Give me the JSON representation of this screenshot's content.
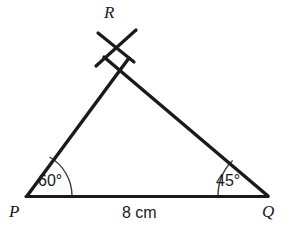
{
  "figure": {
    "background_color": "#ffffff",
    "stroke_color": "#1a1a1a",
    "arc_color": "#3a3a3a",
    "vertices": {
      "P": {
        "label": "P",
        "x": 27,
        "y": 196
      },
      "Q": {
        "label": "Q",
        "x": 268,
        "y": 196
      },
      "R": {
        "label": "R",
        "x": 116,
        "y": 48
      }
    },
    "angles": [
      {
        "at": "P",
        "label": "60°",
        "value": 60,
        "unit": "degrees",
        "arc_radius": 45
      },
      {
        "at": "Q",
        "label": "45°",
        "value": 45,
        "unit": "degrees",
        "arc_radius": 50
      }
    ],
    "sides": [
      {
        "from": "P",
        "to": "Q",
        "label": "8 cm",
        "length": 8,
        "unit": "cm"
      }
    ],
    "construction_marks": {
      "description": "crossing arc strokes at apex R",
      "stroke_1": {
        "x1": 98,
        "y1": 33,
        "x2": 134,
        "y2": 62
      },
      "stroke_2": {
        "x1": 136,
        "y1": 30,
        "x2": 96,
        "y2": 66
      }
    }
  }
}
